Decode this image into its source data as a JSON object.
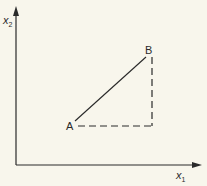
{
  "diagram": {
    "axes": {
      "x_label": "x",
      "x_subscript": "1",
      "y_label": "x",
      "y_subscript": "2"
    },
    "points": [
      {
        "name": "A",
        "label": "A"
      },
      {
        "name": "B",
        "label": "B"
      }
    ],
    "segments": [
      {
        "from": "A",
        "to": "B",
        "style": "solid"
      },
      {
        "from": "A",
        "to": "corner",
        "style": "dashed",
        "direction": "horizontal"
      },
      {
        "from": "corner",
        "to": "B",
        "style": "dashed",
        "direction": "vertical"
      }
    ],
    "colors": {
      "background": "#f8f6ec",
      "ink": "#2a2a2a"
    }
  }
}
